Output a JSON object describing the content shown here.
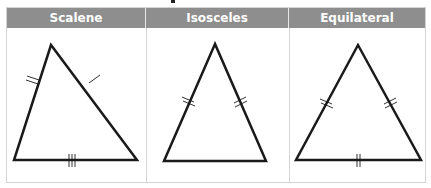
{
  "table": {
    "columns": [
      {
        "label": "Scalene"
      },
      {
        "label": "Isosceles"
      },
      {
        "label": "Equilateral"
      }
    ]
  },
  "triangles": [
    {
      "type": "Scalene",
      "sides": {
        "left": "2 tick marks",
        "right": "1 tick mark",
        "base": "3 tick marks"
      }
    },
    {
      "type": "Isosceles",
      "sides": {
        "left": "2 tick marks",
        "right": "2 tick marks",
        "base": "no marks"
      }
    },
    {
      "type": "Equilateral",
      "sides": {
        "left": "2 tick marks",
        "right": "2 tick marks",
        "base": "2 tick marks"
      }
    }
  ],
  "colors": {
    "header_bg": "#8e8e8e",
    "header_text": "#ffffff",
    "stroke": "#1a1a1a",
    "border": "#d4d4d4"
  }
}
